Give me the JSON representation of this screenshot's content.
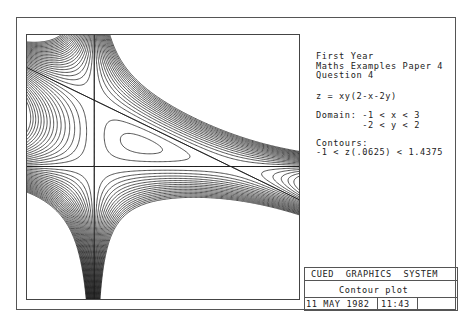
{
  "chart_data": {
    "type": "contour",
    "title": "Contour plot",
    "function": "z = xy(2-x-2y)",
    "xlim": [
      -1,
      3
    ],
    "ylim": [
      -2,
      2
    ],
    "contour_levels": {
      "min": -1,
      "max": 1.4375,
      "step": 0.0625
    },
    "axes_lines": [
      "x = 0",
      "y = 0",
      "2 - x - 2y = 0"
    ],
    "grid": false,
    "legend": null
  },
  "panel": {
    "heading": [
      "First Year",
      "Maths Examples Paper 4",
      "Question 4"
    ],
    "equation": "z = xy(2-x-2y)",
    "domain_line1": "Domain: -1 < x < 3",
    "domain_line2": "        -2 < y < 2",
    "contours_label": "Contours:",
    "contours_range": "-1 < z(.0625) < 1.4375"
  },
  "title_block": {
    "system": "CUED  GRAPHICS  SYSTEM",
    "plot_type": "Contour plot",
    "date": "11 MAY 1982",
    "time": "11:43",
    "blank": ""
  },
  "colors": {
    "ink": "#1a1a1a",
    "frame": "#555555",
    "paper": "#ffffff"
  }
}
